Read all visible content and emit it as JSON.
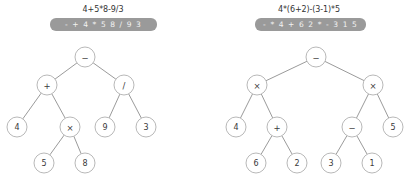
{
  "page": {
    "background_color": "#ffffff",
    "width": 412,
    "height": 185
  },
  "style": {
    "bar_color": "#9a9a9a",
    "bar_text_color": "#f2f2f2",
    "node_fill": "#ffffff",
    "node_stroke": "#b0b0b0",
    "edge_color": "#8f8f8f",
    "text_color": "#333333"
  },
  "panels": [
    {
      "id": "left",
      "infix_expression": "4+5*8-9/3",
      "prefix_expression": "- + 4 * 5 8 / 9 3",
      "tree": {
        "type": "binary-expression-tree",
        "nodes": [
          {
            "id": "n0",
            "label": "−",
            "kind": "operator",
            "x": 85,
            "y": 57,
            "r": 10
          },
          {
            "id": "n1",
            "label": "+",
            "kind": "operator",
            "x": 47,
            "y": 85,
            "r": 10
          },
          {
            "id": "n2",
            "label": "/",
            "kind": "operator",
            "x": 124,
            "y": 85,
            "r": 10
          },
          {
            "id": "n3",
            "label": "4",
            "kind": "operand",
            "x": 17,
            "y": 127,
            "r": 10
          },
          {
            "id": "n4",
            "label": "×",
            "kind": "operator",
            "x": 70,
            "y": 127,
            "r": 10
          },
          {
            "id": "n5",
            "label": "9",
            "kind": "operand",
            "x": 105,
            "y": 127,
            "r": 10
          },
          {
            "id": "n6",
            "label": "3",
            "kind": "operand",
            "x": 146,
            "y": 127,
            "r": 10
          },
          {
            "id": "n7",
            "label": "5",
            "kind": "operand",
            "x": 44,
            "y": 163,
            "r": 10
          },
          {
            "id": "n8",
            "label": "8",
            "kind": "operand",
            "x": 85,
            "y": 163,
            "r": 10
          }
        ],
        "edges": [
          [
            "n0",
            "n1"
          ],
          [
            "n0",
            "n2"
          ],
          [
            "n1",
            "n3"
          ],
          [
            "n1",
            "n4"
          ],
          [
            "n2",
            "n5"
          ],
          [
            "n2",
            "n6"
          ],
          [
            "n4",
            "n7"
          ],
          [
            "n4",
            "n8"
          ]
        ]
      }
    },
    {
      "id": "right",
      "infix_expression": "4*(6+2)-(3-1)*5",
      "prefix_expression": "- * 4 + 6 2 * - 3 1 5",
      "tree": {
        "type": "binary-expression-tree",
        "nodes": [
          {
            "id": "m0",
            "label": "−",
            "kind": "operator",
            "x": 110,
            "y": 57,
            "r": 10
          },
          {
            "id": "m1",
            "label": "×",
            "kind": "operator",
            "x": 51,
            "y": 85,
            "r": 10
          },
          {
            "id": "m2",
            "label": "×",
            "kind": "operator",
            "x": 167,
            "y": 85,
            "r": 10
          },
          {
            "id": "m3",
            "label": "4",
            "kind": "operand",
            "x": 30,
            "y": 127,
            "r": 10
          },
          {
            "id": "m4",
            "label": "+",
            "kind": "operator",
            "x": 71,
            "y": 127,
            "r": 10
          },
          {
            "id": "m5",
            "label": "−",
            "kind": "operator",
            "x": 146,
            "y": 127,
            "r": 10
          },
          {
            "id": "m6",
            "label": "5",
            "kind": "operand",
            "x": 187,
            "y": 127,
            "r": 10
          },
          {
            "id": "m7",
            "label": "6",
            "kind": "operand",
            "x": 50,
            "y": 163,
            "r": 10
          },
          {
            "id": "m8",
            "label": "2",
            "kind": "operand",
            "x": 91,
            "y": 163,
            "r": 10
          },
          {
            "id": "m9",
            "label": "3",
            "kind": "operand",
            "x": 125,
            "y": 163,
            "r": 10
          },
          {
            "id": "m10",
            "label": "1",
            "kind": "operand",
            "x": 166,
            "y": 163,
            "r": 10
          }
        ],
        "edges": [
          [
            "m0",
            "m1"
          ],
          [
            "m0",
            "m2"
          ],
          [
            "m1",
            "m3"
          ],
          [
            "m1",
            "m4"
          ],
          [
            "m2",
            "m5"
          ],
          [
            "m2",
            "m6"
          ],
          [
            "m4",
            "m7"
          ],
          [
            "m4",
            "m8"
          ],
          [
            "m5",
            "m9"
          ],
          [
            "m5",
            "m10"
          ]
        ]
      }
    }
  ]
}
